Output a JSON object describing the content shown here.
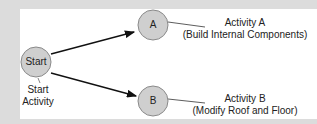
{
  "nodes": {
    "start": {
      "label": "Start",
      "caption_line1": "Start",
      "caption_line2": "Activity"
    },
    "a": {
      "label": "A",
      "caption_line1": "Activity A",
      "caption_line2": "(Build Internal Components)"
    },
    "b": {
      "label": "B",
      "caption_line1": "Activity B",
      "caption_line2": "(Modify Roof and Floor)"
    }
  },
  "colors": {
    "node_fill": "#cfcfcf",
    "node_stroke": "#8a8a8a",
    "edge": "#111111",
    "background": "#dcdcdc",
    "panel": "#ffffff"
  }
}
